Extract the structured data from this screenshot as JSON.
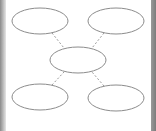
{
  "diagram": {
    "type": "hub-and-spoke",
    "colors": {
      "node_stroke": "#8c8c8c",
      "edge_stroke": "#9a9a9a",
      "background": "#ffffff",
      "frame": "#8a8a8a"
    },
    "nodes": [
      {
        "id": "top-left",
        "label": "",
        "cx": 40,
        "cy": 21,
        "rx": 28,
        "ry": 13
      },
      {
        "id": "top-right",
        "label": "",
        "cx": 116,
        "cy": 21,
        "rx": 28,
        "ry": 13
      },
      {
        "id": "center",
        "label": "",
        "cx": 78,
        "cy": 60,
        "rx": 28,
        "ry": 13
      },
      {
        "id": "bottom-left",
        "label": "",
        "cx": 40,
        "cy": 97,
        "rx": 28,
        "ry": 13
      },
      {
        "id": "bottom-right",
        "label": "",
        "cx": 116,
        "cy": 98,
        "rx": 28,
        "ry": 13
      }
    ],
    "edges": [
      {
        "from": "top-left",
        "to": "center",
        "style": "dashed"
      },
      {
        "from": "top-right",
        "to": "center",
        "style": "dashed"
      },
      {
        "from": "bottom-left",
        "to": "center",
        "style": "dashed"
      },
      {
        "from": "bottom-right",
        "to": "center",
        "style": "dashed"
      }
    ]
  }
}
